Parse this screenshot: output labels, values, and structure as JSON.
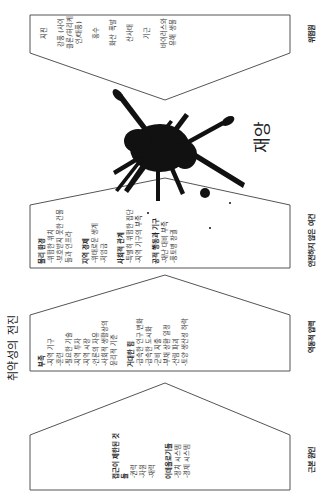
{
  "title": "취약성의 전진",
  "stages": [
    {
      "label": "근본 원인",
      "groups": [
        {
          "heading": "접근이 제한된 것들",
          "items": [
            "-권력",
            "-자원",
            "-재력"
          ]
        },
        {
          "heading": "이데올로기들",
          "items": [
            "-정치 시스템",
            "-경제 시스템"
          ]
        }
      ]
    },
    {
      "label": "역동적 압력",
      "groups": [
        {
          "heading": "부족",
          "items": [
            "-지역 기구",
            "-훈련",
            "-필요한 기술",
            "-지역 투자",
            "-지역 시장",
            "-언론의 자유",
            "-사회적 생활상의 윤리적 기준"
          ]
        },
        {
          "heading": "거대한 힘",
          "items": [
            "-급속한 인구 변화",
            "-급속한 도시화",
            "-군비 지출",
            "-부채 상환 일정",
            "-산림 파괴",
            "-토양 생산성 하락"
          ]
        }
      ]
    },
    {
      "label": "안전하지 않은 여건",
      "groups": [
        {
          "heading": "물리 환경",
          "items": [
            "-위험한 위치",
            "-보호받지 못한 건물들과 인프라"
          ]
        },
        {
          "heading": "지역 경제",
          "items": [
            "-위태로운 생계",
            "-저임금"
          ]
        },
        {
          "heading": "사회적 관계",
          "items": [
            "-특별히 위험한 집단",
            "-지역 기구의 부족"
          ]
        },
        {
          "heading": "공적 행동과 기구",
          "items": [
            "-재난 대비 부족",
            "-풍토병 창궐"
          ]
        }
      ]
    }
  ],
  "disaster": {
    "label": "재앙",
    "icon": "ink-splat-icon"
  },
  "hazards": {
    "label": "위험원",
    "items": [
      "지진",
      "강풍 (사이클론/허리케인/태풍)",
      "홍수",
      "화산 폭발",
      "산사태",
      "기근",
      "바이러스와 유해 생물"
    ]
  },
  "colors": {
    "line": "#555555",
    "ink": "#111111",
    "text": "#333333"
  }
}
